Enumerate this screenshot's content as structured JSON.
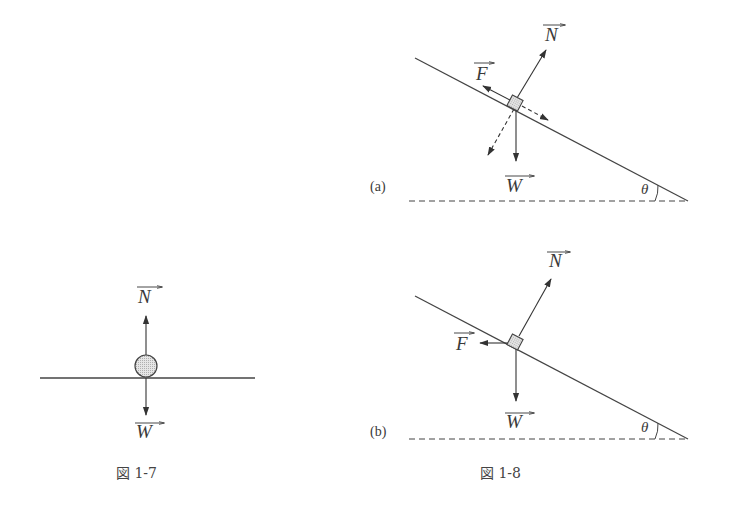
{
  "figures": [
    {
      "id": "fig-1-7",
      "caption": "図 1-7",
      "forces": [
        {
          "symbol": "N",
          "direction": "up"
        },
        {
          "symbol": "W",
          "direction": "down"
        }
      ],
      "object": "ball on horizontal surface"
    },
    {
      "id": "fig-1-8",
      "caption": "図 1-8",
      "panels": [
        {
          "label": "(a)",
          "angle_symbol": "θ",
          "forces": [
            {
              "symbol": "N",
              "direction": "perpendicular to incline"
            },
            {
              "symbol": "F",
              "direction": "up along incline"
            },
            {
              "symbol": "W",
              "direction": "down"
            }
          ],
          "components": [
            "along incline (dashed)",
            "into incline (dashed)"
          ]
        },
        {
          "label": "(b)",
          "angle_symbol": "θ",
          "forces": [
            {
              "symbol": "N",
              "direction": "perpendicular to incline"
            },
            {
              "symbol": "F",
              "direction": "horizontal left"
            },
            {
              "symbol": "W",
              "direction": "down"
            }
          ]
        }
      ]
    }
  ],
  "labels": {
    "N": "N",
    "F": "F",
    "W": "W",
    "theta": "θ",
    "panel_a": "(a)",
    "panel_b": "(b)",
    "caption_7": "図 1-7",
    "caption_8": "図 1-8"
  }
}
